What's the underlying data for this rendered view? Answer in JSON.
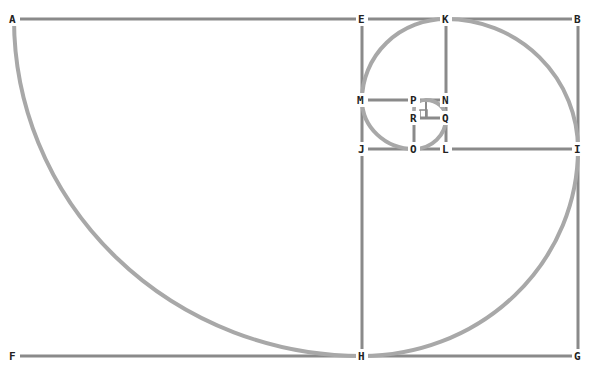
{
  "diagram": {
    "colors": {
      "frame": "#8a8a8a",
      "spiral": "#a8a8a8",
      "label": "#222222",
      "background": "#ffffff"
    },
    "points": [
      {
        "id": "A",
        "x": 14,
        "y": 19
      },
      {
        "id": "E",
        "x": 362,
        "y": 19
      },
      {
        "id": "K",
        "x": 446,
        "y": 19
      },
      {
        "id": "B",
        "x": 578,
        "y": 19
      },
      {
        "id": "M",
        "x": 362,
        "y": 100
      },
      {
        "id": "P",
        "x": 414,
        "y": 100
      },
      {
        "id": "N",
        "x": 446,
        "y": 100
      },
      {
        "id": "R",
        "x": 414,
        "y": 118
      },
      {
        "id": "Q",
        "x": 446,
        "y": 118
      },
      {
        "id": "J",
        "x": 362,
        "y": 149
      },
      {
        "id": "O",
        "x": 414,
        "y": 149
      },
      {
        "id": "L",
        "x": 446,
        "y": 149
      },
      {
        "id": "I",
        "x": 578,
        "y": 149
      },
      {
        "id": "F",
        "x": 14,
        "y": 356
      },
      {
        "id": "H",
        "x": 362,
        "y": 356
      },
      {
        "id": "G",
        "x": 578,
        "y": 356
      }
    ],
    "segments": [
      [
        "A",
        "B"
      ],
      [
        "B",
        "G"
      ],
      [
        "F",
        "G"
      ],
      [
        "A",
        "F"
      ],
      [
        "E",
        "H"
      ],
      [
        "J",
        "I"
      ],
      [
        "K",
        "N"
      ],
      [
        "M",
        "N"
      ],
      [
        "P",
        "O"
      ],
      [
        "N",
        "L"
      ],
      [
        "R",
        "Q"
      ]
    ],
    "spiral_arcs": [
      {
        "from": "A",
        "to": "H",
        "center": "E"
      },
      {
        "from": "H",
        "to": "I",
        "center": "J"
      },
      {
        "from": "I",
        "to": "K",
        "center": "L"
      },
      {
        "from": "K",
        "to": "M",
        "center": "N"
      },
      {
        "from": "M",
        "to": "O",
        "center": "P"
      },
      {
        "from": "O",
        "to": "Q",
        "center": "R"
      },
      {
        "from": "Q",
        "to": "P-N midpoint",
        "center": "R-Q"
      }
    ],
    "labels": {
      "A": "A",
      "B": "B",
      "E": "E",
      "K": "K",
      "M": "M",
      "P": "P",
      "N": "N",
      "R": "R",
      "Q": "Q",
      "J": "J",
      "O": "O",
      "L": "L",
      "I": "I",
      "F": "F",
      "H": "H",
      "G": "G"
    }
  }
}
